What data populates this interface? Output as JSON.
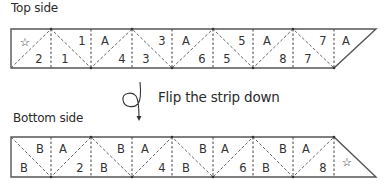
{
  "labels": {
    "top_side": "Top side",
    "bottom_side": "Bottom side",
    "flip_instruction": "Flip the strip down"
  },
  "top_strip": {
    "cells": [
      {
        "text": "☆",
        "x": 25,
        "y": 46,
        "kind": "star-icon"
      },
      {
        "text": "2",
        "x": 39,
        "y": 63
      },
      {
        "text": "1",
        "x": 65,
        "y": 63
      },
      {
        "text": "1",
        "x": 82,
        "y": 45
      },
      {
        "text": "A",
        "x": 105,
        "y": 45
      },
      {
        "text": "4",
        "x": 122,
        "y": 63
      },
      {
        "text": "3",
        "x": 162,
        "y": 45
      },
      {
        "text": "3",
        "x": 146,
        "y": 63
      },
      {
        "text": "A",
        "x": 186,
        "y": 45
      },
      {
        "text": "6",
        "x": 202,
        "y": 63
      },
      {
        "text": "5",
        "x": 242,
        "y": 45
      },
      {
        "text": "5",
        "x": 227,
        "y": 63
      },
      {
        "text": "A",
        "x": 267,
        "y": 45
      },
      {
        "text": "8",
        "x": 283,
        "y": 63
      },
      {
        "text": "7",
        "x": 323,
        "y": 45
      },
      {
        "text": "7",
        "x": 308,
        "y": 63
      },
      {
        "text": "A",
        "x": 346,
        "y": 45
      }
    ]
  },
  "bottom_strip": {
    "cells": [
      {
        "text": "B",
        "x": 24,
        "y": 172
      },
      {
        "text": "B",
        "x": 40,
        "y": 153
      },
      {
        "text": "A",
        "x": 63,
        "y": 153
      },
      {
        "text": "2",
        "x": 80,
        "y": 172
      },
      {
        "text": "B",
        "x": 104,
        "y": 172
      },
      {
        "text": "B",
        "x": 121,
        "y": 153
      },
      {
        "text": "A",
        "x": 145,
        "y": 153
      },
      {
        "text": "4",
        "x": 162,
        "y": 172
      },
      {
        "text": "B",
        "x": 186,
        "y": 172
      },
      {
        "text": "B",
        "x": 203,
        "y": 153
      },
      {
        "text": "A",
        "x": 225,
        "y": 153
      },
      {
        "text": "6",
        "x": 243,
        "y": 172
      },
      {
        "text": "B",
        "x": 266,
        "y": 172
      },
      {
        "text": "B",
        "x": 283,
        "y": 153
      },
      {
        "text": "A",
        "x": 306,
        "y": 153
      },
      {
        "text": "8",
        "x": 323,
        "y": 172
      },
      {
        "text": "☆",
        "x": 347,
        "y": 166,
        "kind": "star-icon"
      }
    ]
  }
}
